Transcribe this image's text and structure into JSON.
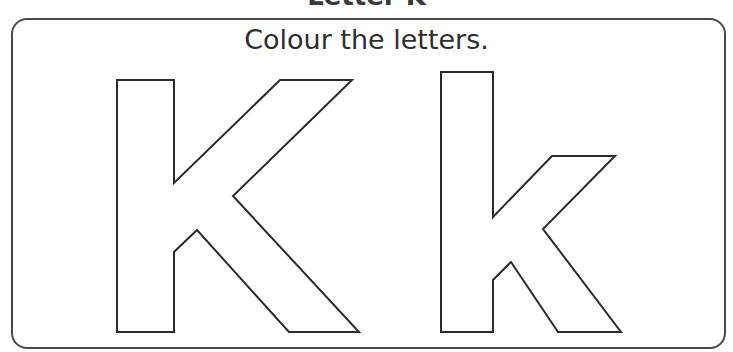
{
  "worksheet": {
    "top_title_partial": "Letter K",
    "instruction": "Colour the letters."
  },
  "letters": [
    {
      "label": "uppercase K",
      "char": "K"
    },
    {
      "label": "lowercase k",
      "char": "k"
    }
  ],
  "colors": {
    "outline": "#2b2b2b",
    "frame": "#4a4a4a",
    "text": "#2e2e2e"
  }
}
